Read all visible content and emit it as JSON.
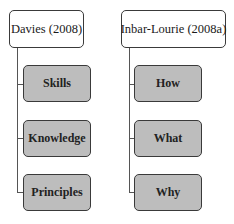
{
  "diagram": {
    "type": "hierarchy",
    "trees": [
      {
        "root": "Davies (2008)",
        "children": [
          "Skills",
          "Knowledge",
          "Principles"
        ]
      },
      {
        "root": "Inbar-Lourie (2008a)",
        "children": [
          "How",
          "What",
          "Why"
        ]
      }
    ],
    "colors": {
      "root_fill": "#ffffff",
      "child_fill": "#bdbdbd",
      "border": "#3a3a3a",
      "connector": "#555555"
    }
  }
}
